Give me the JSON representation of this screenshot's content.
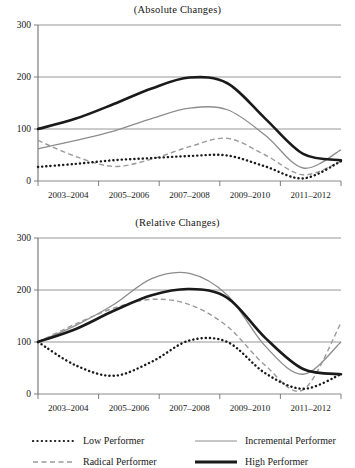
{
  "figure": {
    "panels": [
      {
        "title": "(Absolute Changes)"
      },
      {
        "title": "(Relative Changes)"
      }
    ]
  },
  "axis": {
    "y_ticks": [
      "0",
      "100",
      "200",
      "300"
    ],
    "x_ticks": [
      "2003–2004",
      "2005–2006",
      "2007–2008",
      "2009–2010",
      "2011–2012"
    ]
  },
  "legend": {
    "items": [
      {
        "label": "Low Performer",
        "style": "dotted",
        "color": "#1a1a1a"
      },
      {
        "label": "Incremental Performer",
        "style": "solid-thin",
        "color": "#8d8d8d"
      },
      {
        "label": "Radical Performer",
        "style": "dashed",
        "color": "#9a9a9a"
      },
      {
        "label": "High Performer",
        "style": "solid-thick",
        "color": "#1a1a1a"
      }
    ]
  },
  "colors": {
    "low": "#1a1a1a",
    "radical": "#9a9a9a",
    "incremental": "#8d8d8d",
    "high": "#1a1a1a",
    "grid": "#8a8a8a",
    "axis": "#6f6f6f"
  },
  "chart_data": [
    {
      "type": "line",
      "title": "(Absolute Changes)",
      "xlabel": "",
      "ylabel": "",
      "ylim": [
        0,
        300
      ],
      "grid": true,
      "legend_position": "bottom",
      "categories": [
        "2003–2004",
        "2005–2006",
        "2007–2008",
        "2009–2010",
        "2011–2012"
      ],
      "x": [
        0,
        0.5,
        1,
        1.5,
        2,
        2.5,
        3,
        3.5,
        4
      ],
      "series": [
        {
          "name": "Low Performer",
          "values": [
            27,
            33,
            40,
            44,
            48,
            49,
            28,
            5,
            38
          ]
        },
        {
          "name": "Radical Performer",
          "values": [
            78,
            47,
            28,
            42,
            66,
            82,
            50,
            12,
            38
          ]
        },
        {
          "name": "Incremental Performer",
          "values": [
            62,
            78,
            96,
            120,
            140,
            137,
            88,
            25,
            60
          ]
        },
        {
          "name": "High Performer",
          "values": [
            100,
            120,
            148,
            178,
            199,
            188,
            120,
            52,
            40
          ]
        }
      ]
    },
    {
      "type": "line",
      "title": "(Relative Changes)",
      "xlabel": "",
      "ylabel": "",
      "ylim": [
        0,
        300
      ],
      "grid": true,
      "legend_position": "bottom",
      "categories": [
        "2003–2004",
        "2005–2006",
        "2007–2008",
        "2009–2010",
        "2011–2012"
      ],
      "x": [
        0,
        0.5,
        1,
        1.5,
        2,
        2.5,
        3,
        3.5,
        4
      ],
      "series": [
        {
          "name": "Low Performer",
          "values": [
            100,
            55,
            35,
            62,
            103,
            100,
            40,
            10,
            38
          ]
        },
        {
          "name": "Radical Performer",
          "values": [
            100,
            135,
            165,
            182,
            172,
            130,
            55,
            8,
            137
          ]
        },
        {
          "name": "Incremental Performer",
          "values": [
            100,
            132,
            172,
            222,
            232,
            190,
            92,
            38,
            100
          ]
        },
        {
          "name": "High Performer",
          "values": [
            100,
            125,
            160,
            190,
            202,
            185,
            108,
            48,
            38
          ]
        }
      ]
    }
  ]
}
